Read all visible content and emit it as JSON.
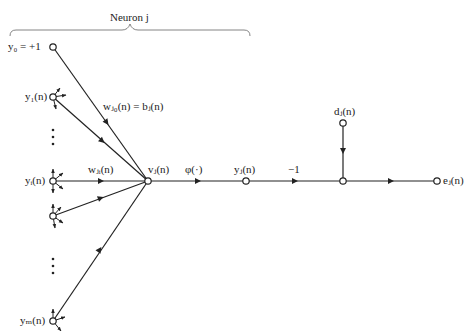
{
  "diagram": {
    "title": "Neuron j",
    "nodes": {
      "y0": {
        "label": "y₀ = +1",
        "x": 53,
        "y": 47
      },
      "y1": {
        "label": "y₁(n)",
        "x": 53,
        "y": 97
      },
      "yi": {
        "label": "yᵢ(n)",
        "x": 53,
        "y": 181
      },
      "yk": {
        "label": "",
        "x": 53,
        "y": 216
      },
      "ym": {
        "label": "yₘ(n)",
        "x": 53,
        "y": 321
      },
      "vj": {
        "label": "vⱼ(n)",
        "x": 148,
        "y": 181
      },
      "yj": {
        "label": "yⱼ(n)",
        "x": 246,
        "y": 181
      },
      "sum": {
        "label": "",
        "x": 343,
        "y": 181
      },
      "dj": {
        "label": "dⱼ(n)",
        "x": 343,
        "y": 123
      },
      "ej": {
        "label": "eⱼ(n)",
        "x": 437,
        "y": 181
      }
    },
    "edge_labels": {
      "bias_weight": "wⱼ₀(n) = bⱼ(n)",
      "input_weight": "wⱼᵢ(n)",
      "activation": "φ(·)",
      "negation": "−1"
    },
    "ellipsis": "⋮",
    "stroke_color": "#222222"
  }
}
